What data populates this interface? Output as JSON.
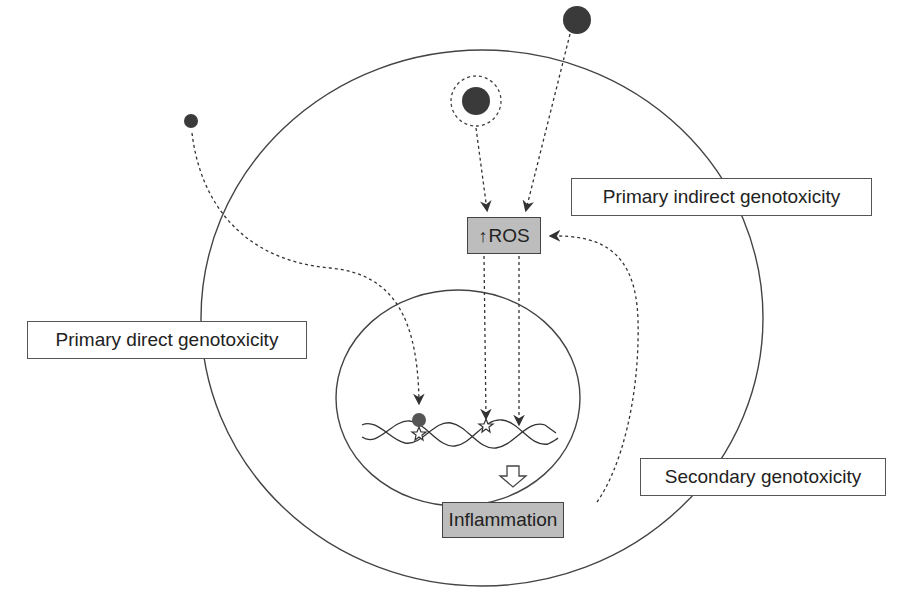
{
  "labels": {
    "primary_indirect": "Primary indirect genotoxicity",
    "primary_direct": "Primary direct genotoxicity",
    "secondary": "Secondary genotoxicity"
  },
  "nodes": {
    "ros": {
      "arrow": "↑",
      "text": "ROS"
    },
    "inflammation": {
      "text": "Inflammation"
    }
  },
  "colors": {
    "particle": "#3a3a3a",
    "node_fill": "#bdbdbd",
    "line": "#444444"
  },
  "structures": {
    "outer_circle": "cell",
    "inner_circle": "nucleus",
    "dna": "double-helix DNA",
    "particles": [
      "small particle",
      "coated particle (dashed ring)",
      "large particle"
    ]
  }
}
